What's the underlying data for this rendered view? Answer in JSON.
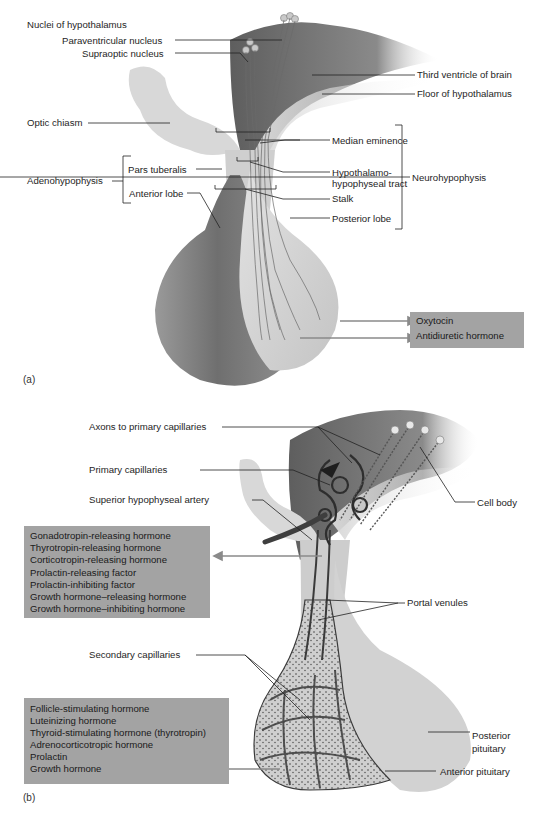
{
  "panel_a": {
    "tag": "(a)",
    "labels": {
      "nuclei_heading": "Nuclei of hypothalamus",
      "paraventricular": "Paraventricular nucleus",
      "supraoptic": "Supraoptic nucleus",
      "third_ventricle": "Third ventricle of brain",
      "floor_hypothalamus": "Floor of hypothalamus",
      "optic_chiasm": "Optic chiasm",
      "median_eminence": "Median eminence",
      "tract_line1": "Hypothalamo-",
      "tract_line2": "hypophyseal tract",
      "stalk": "Stalk",
      "posterior_lobe": "Posterior lobe",
      "neurohypophysis": "Neurohypophysis",
      "adenohypophysis": "Adenohypophysis",
      "pars_tuberalis": "Pars tuberalis",
      "anterior_lobe": "Anterior lobe"
    },
    "hormone_box": [
      "Oxytocin",
      "Antidiuretic hormone"
    ]
  },
  "panel_b": {
    "tag": "(b)",
    "labels": {
      "axons": "Axons to primary capillaries",
      "primary_capillaries": "Primary capillaries",
      "sup_artery": "Superior hypophyseal artery",
      "cell_body": "Cell body",
      "portal_venules": "Portal venules",
      "secondary_capillaries": "Secondary capillaries",
      "posterior_line1": "Posterior",
      "posterior_line2": "pituitary",
      "anterior_pituitary": "Anterior pituitary"
    },
    "releasing_box": [
      "Gonadotropin-releasing hormone",
      "Thyrotropin-releasing hormone",
      "Corticotropin-releasing hormone",
      "Prolactin-releasing factor",
      "Prolactin-inhibiting factor",
      "Growth hormone–releasing hormone",
      "Growth hormone–inhibiting hormone"
    ],
    "anterior_box": [
      "Follicle-stimulating hormone",
      "Luteinizing hormone",
      "Thyroid-stimulating hormone (thyrotropin)",
      "Adrenocorticotropic hormone",
      "Prolactin",
      "Growth hormone"
    ]
  },
  "colors": {
    "box_fill": "#a3a3a3",
    "anterior_tissue": "#7f7f7f",
    "posterior_tissue": "#d2d2d2",
    "vessel": "#3a3a3a",
    "arrow": "#8a8a8a"
  }
}
